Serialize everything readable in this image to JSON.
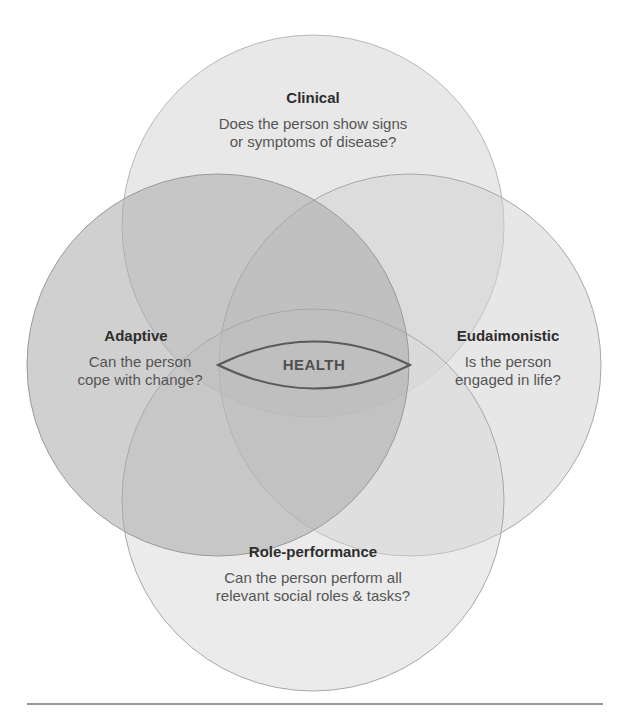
{
  "diagram": {
    "type": "venn",
    "center_label": "HEALTH",
    "colors": {
      "background": "#ffffff",
      "circle_fill": "#c8c8c8",
      "circle_stroke": "#a8a8a8",
      "lens_stroke": "#5a5a5a",
      "text_title": "#2e2e2e",
      "text_question": "#555555",
      "divider": "#9a9a9a"
    },
    "sets": [
      {
        "id": "clinical",
        "position": "top",
        "title": "Clinical",
        "question_line1": "Does the person show signs",
        "question_line2": "or symptoms of disease?"
      },
      {
        "id": "adaptive",
        "position": "left",
        "title": "Adaptive",
        "question_line1": "Can the person",
        "question_line2": "cope with change?"
      },
      {
        "id": "eudaimonistic",
        "position": "right",
        "title": "Eudaimonistic",
        "question_line1": "Is the person",
        "question_line2": "engaged in life?"
      },
      {
        "id": "role-performance",
        "position": "bottom",
        "title": "Role-performance",
        "question_line1": "Can the person perform all",
        "question_line2": "relevant social roles & tasks?"
      }
    ]
  }
}
